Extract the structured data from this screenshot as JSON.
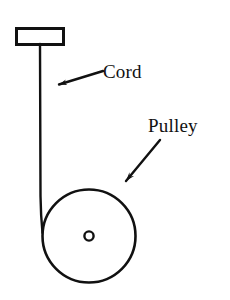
{
  "figure": {
    "kind": "physics-diagram",
    "background_color": "#ffffff",
    "stroke_color": "#111111",
    "text_color": "#111111"
  },
  "labels": {
    "cord": "Cord",
    "pulley": "Pulley"
  },
  "parts": {
    "ceiling_bracket": {
      "name": "ceiling-bracket",
      "shape": "rectangle",
      "x": 16,
      "y": 28,
      "width": 47,
      "height": 16
    },
    "cord": {
      "name": "cord",
      "shape": "line",
      "x1": 40,
      "y1": 44,
      "x2": 42,
      "y2": 236
    },
    "pulley_wheel": {
      "name": "pulley-wheel",
      "shape": "circle",
      "cx": 89,
      "cy": 236,
      "r": 48
    },
    "pulley_hub": {
      "name": "pulley-hub",
      "shape": "circle",
      "cx": 89,
      "cy": 236,
      "r": 5
    }
  },
  "annotations": {
    "cord_arrow": {
      "name": "cord-leader-arrow",
      "tail_x": 103,
      "tail_y": 71,
      "tip_x": 57,
      "tip_y": 85
    },
    "pulley_arrow": {
      "name": "pulley-leader-arrow",
      "tail_x": 160,
      "tail_y": 140,
      "tip_x": 124,
      "tip_y": 184
    },
    "cord_label_pos": {
      "x": 103,
      "y": 77
    },
    "pulley_label_pos": {
      "x": 148,
      "y": 131
    }
  }
}
